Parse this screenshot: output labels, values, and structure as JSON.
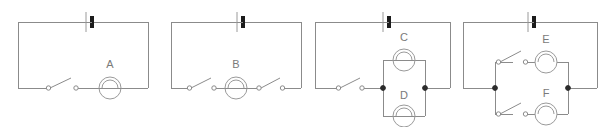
{
  "figure": {
    "background_color": "#ffffff",
    "wire_color": "#8b8b8b",
    "symbol_color": "#9a9a9a",
    "node_color": "#2b2b2b",
    "battery_terminal_color": "#1c1c1c",
    "label_color": "#7a7a7a"
  },
  "circuits": [
    {
      "id": "circuit-1",
      "arrangement": "series",
      "components": {
        "battery": {
          "name": "battery-cell",
          "position": "top-center"
        },
        "switches": [
          {
            "name": "switch-1",
            "state": "open",
            "position": "bottom-left"
          }
        ],
        "lamps": [
          {
            "name": "lamp-a",
            "label": "A",
            "position": "bottom-center"
          }
        ]
      }
    },
    {
      "id": "circuit-2",
      "arrangement": "series",
      "components": {
        "battery": {
          "name": "battery-cell",
          "position": "top-center"
        },
        "switches": [
          {
            "name": "switch-1",
            "state": "open",
            "position": "bottom-left"
          },
          {
            "name": "switch-2",
            "state": "open",
            "position": "bottom-right"
          }
        ],
        "lamps": [
          {
            "name": "lamp-b",
            "label": "B",
            "position": "bottom-center"
          }
        ]
      }
    },
    {
      "id": "circuit-3",
      "arrangement": "parallel-lamps",
      "components": {
        "battery": {
          "name": "battery-cell",
          "position": "top-center"
        },
        "switches": [
          {
            "name": "switch-1",
            "state": "open",
            "position": "bottom-left"
          }
        ],
        "lamps": [
          {
            "name": "lamp-c",
            "label": "C",
            "position": "upper-branch"
          },
          {
            "name": "lamp-d",
            "label": "D",
            "position": "lower-branch"
          }
        ],
        "junction_nodes": 2
      }
    },
    {
      "id": "circuit-4",
      "arrangement": "parallel-branches",
      "components": {
        "battery": {
          "name": "battery-cell",
          "position": "top-center"
        },
        "switches": [
          {
            "name": "switch-1",
            "state": "open",
            "position": "upper-branch"
          },
          {
            "name": "switch-2",
            "state": "open",
            "position": "lower-branch"
          }
        ],
        "lamps": [
          {
            "name": "lamp-e",
            "label": "E",
            "position": "upper-branch"
          },
          {
            "name": "lamp-f",
            "label": "F",
            "position": "lower-branch"
          }
        ],
        "junction_nodes": 2
      }
    }
  ],
  "labels": {
    "a": "A",
    "b": "B",
    "c": "C",
    "d": "D",
    "e": "E",
    "f": "F"
  }
}
